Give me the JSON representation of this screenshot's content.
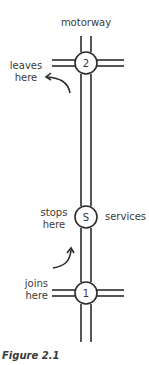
{
  "diagram": {
    "title": "motorway",
    "caption": "Figure 2.1",
    "junctions": [
      {
        "id": "2",
        "label": "2",
        "note": [
          "leaves",
          "here"
        ]
      },
      {
        "id": "S",
        "label": "S",
        "note": [
          "stops",
          "here"
        ],
        "side_label": "services"
      },
      {
        "id": "1",
        "label": "1",
        "note": [
          "joins",
          "here"
        ]
      }
    ],
    "colors": {
      "line": "#2b2b2b",
      "background": "#ffffff"
    }
  }
}
